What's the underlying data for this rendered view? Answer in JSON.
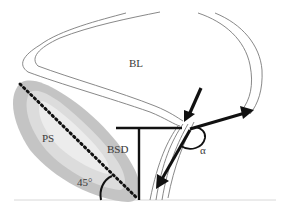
{
  "diagram": {
    "labels": {
      "bladder": "BL",
      "pubic_symphysis": "PS",
      "bladder_symphysis_distance": "BSD",
      "angle_45": "45°",
      "angle_alpha": "α"
    },
    "colors": {
      "outline": "#7a7a7a",
      "symphysis_outer": "#c4c4c4",
      "symphysis_inner": "#e2e2e2",
      "lines": "#111111",
      "baseline": "#d8d8d8"
    }
  }
}
